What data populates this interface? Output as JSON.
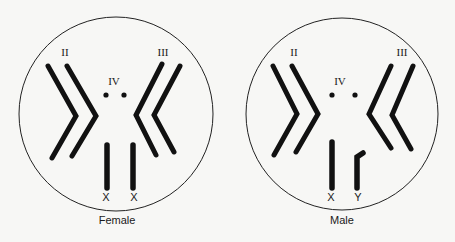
{
  "figure": {
    "type": "karyotype diagram",
    "colors": {
      "ink": "#111111",
      "paper": "#f7f7f5"
    },
    "panels": [
      {
        "id": "female",
        "caption": "Female",
        "labels": {
          "chrom2": "II",
          "chrom3": "III",
          "chrom4": "IV",
          "sex1": "X",
          "sex2": "X"
        }
      },
      {
        "id": "male",
        "caption": "Male",
        "labels": {
          "chrom2": "II",
          "chrom3": "III",
          "chrom4": "IV",
          "sex1": "X",
          "sex2": "Y"
        }
      }
    ]
  }
}
